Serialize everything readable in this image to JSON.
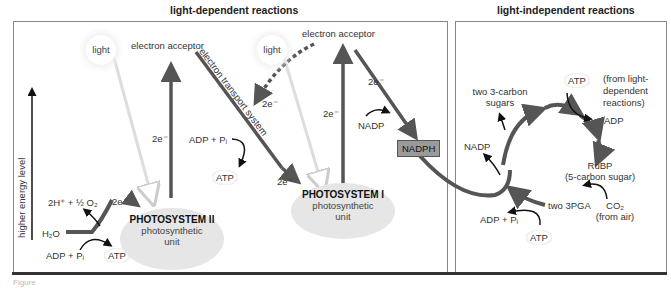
{
  "headers": {
    "left": "light-dependent reactions",
    "right": "light-independent reactions"
  },
  "axis": {
    "label": "higher energy level"
  },
  "light_dependent": {
    "light_1": "light",
    "light_2": "light",
    "acceptor_1": "electron acceptor",
    "acceptor_2": "electron acceptor",
    "ets": "electron transport system",
    "water": "H₂O",
    "products": "2H⁺ + ½ O₂",
    "e_split": "2e⁻",
    "e_ps2_up": "2e⁻",
    "e_ets_bottom": "2e⁻",
    "e_dashed": "2e⁻",
    "e_ps1_up": "2e⁻",
    "e_nadph": "2e⁻",
    "adp_1": "ADP + Pᵢ",
    "atp_1": "ATP",
    "adp_2": "ADP + Pᵢ",
    "atp_2": "ATP",
    "nadp": "NADP",
    "nadph": "NADPH",
    "ps2": {
      "title": "PHOTOSYSTEM II",
      "line1": "photosynthetic",
      "line2": "unit"
    },
    "ps1": {
      "title": "PHOTOSYSTEM I",
      "line1": "photosynthetic",
      "line2": "unit"
    }
  },
  "light_independent": {
    "atp_top": "ATP",
    "from_light": "(from light-\ndependent\nreactions)",
    "from_1": "(from light-",
    "from_2": "dependent",
    "from_3": "reactions)",
    "adp": "ADP",
    "sugars_1": "two 3-carbon",
    "sugars_2": "sugars",
    "nadp": "NADP",
    "rubp_1": "RuBP",
    "rubp_2": "(5-carbon sugar)",
    "pga": "two 3PGA",
    "co2": "CO₂",
    "co2_src": "(from air)",
    "adp_pi": "ADP + Pᵢ",
    "atp_bottom": "ATP"
  },
  "footer": {
    "caption": "Figure"
  },
  "colors": {
    "arrow": "#555555",
    "panel_border": "#888888",
    "ps_fill": "#e6e6e6",
    "nadph_fill": "#9a9a9a"
  }
}
